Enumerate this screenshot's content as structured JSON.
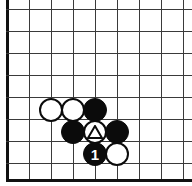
{
  "figure": {
    "caption": "12",
    "width": 192,
    "height": 186,
    "background": "#ffffff"
  },
  "board": {
    "type": "go-board-diagram",
    "line_color": "#3a3a3a",
    "edge_color": "#111111",
    "grid_spacing": 22,
    "origin": {
      "x": 7,
      "y": 9
    },
    "vertical_lines": [
      7,
      29,
      51,
      73,
      95,
      117,
      139,
      161,
      183
    ],
    "horizontal_lines": [
      9,
      31,
      53,
      75,
      97,
      119,
      141,
      163,
      179
    ],
    "edges": {
      "left": true,
      "bottom": true,
      "top": false,
      "right": false
    }
  },
  "stones": [
    {
      "id": "w1",
      "color": "white",
      "x": 51,
      "y": 110,
      "marker": "none",
      "label": ""
    },
    {
      "id": "w2",
      "color": "white",
      "x": 73,
      "y": 110,
      "marker": "none",
      "label": ""
    },
    {
      "id": "b1",
      "color": "black",
      "x": 95,
      "y": 110,
      "marker": "none",
      "label": ""
    },
    {
      "id": "b2",
      "color": "black",
      "x": 73,
      "y": 132,
      "marker": "none",
      "label": ""
    },
    {
      "id": "w3",
      "color": "white",
      "x": 95,
      "y": 132,
      "marker": "triangle",
      "label": ""
    },
    {
      "id": "b3",
      "color": "black",
      "x": 117,
      "y": 132,
      "marker": "none",
      "label": ""
    },
    {
      "id": "b4",
      "color": "black",
      "x": 95,
      "y": 154,
      "marker": "number",
      "label": "1"
    },
    {
      "id": "w4",
      "color": "white",
      "x": 117,
      "y": 154,
      "marker": "none",
      "label": ""
    }
  ],
  "colors": {
    "black_stone": "#0b0b0b",
    "white_stone": "#ffffff",
    "stone_outline": "#0b0b0b",
    "number_text": "#ffffff"
  }
}
